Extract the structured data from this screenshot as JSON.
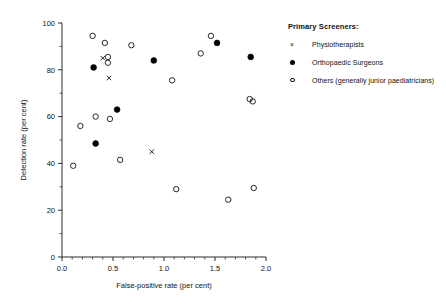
{
  "chart_data": {
    "type": "scatter",
    "title": "",
    "xlabel": "False-positive rate (per cent)",
    "ylabel": "Detection rate (per cent)",
    "xlim": [
      0.0,
      2.0
    ],
    "ylim": [
      0,
      100
    ],
    "xticks": [
      0.0,
      0.5,
      1.0,
      1.5,
      2.0
    ],
    "xtick_labels": [
      "0.0",
      "0.5",
      "1.0",
      "1.5",
      "2.0"
    ],
    "yticks": [
      0,
      20,
      40,
      60,
      80,
      100
    ],
    "ytick_labels": [
      "0",
      "20",
      "40",
      "60",
      "80",
      "100"
    ],
    "x_minor_step": 0.1,
    "y_minor_step": 10,
    "grid": false,
    "legend_position": "right-outside",
    "legend_title": "Primary Screeners:",
    "series": [
      {
        "name": "Physiotherapists",
        "marker": "cross",
        "color": "#111111",
        "points": [
          {
            "x": 0.4,
            "y": 85.0
          },
          {
            "x": 0.46,
            "y": 76.5
          },
          {
            "x": 0.88,
            "y": 45.0
          }
        ]
      },
      {
        "name": "Orthopaedic Surgeons",
        "marker": "filled-circle",
        "color": "#000000",
        "points": [
          {
            "x": 0.31,
            "y": 81.0
          },
          {
            "x": 0.33,
            "y": 48.5
          },
          {
            "x": 0.54,
            "y": 63.0
          },
          {
            "x": 0.9,
            "y": 84.0
          },
          {
            "x": 1.52,
            "y": 91.5
          },
          {
            "x": 1.85,
            "y": 85.5
          }
        ]
      },
      {
        "name": "Others (generally junior paediatricians)",
        "marker": "open-circle",
        "color": "#111111",
        "points": [
          {
            "x": 0.11,
            "y": 39.0
          },
          {
            "x": 0.18,
            "y": 56.0
          },
          {
            "x": 0.3,
            "y": 94.5
          },
          {
            "x": 0.33,
            "y": 60.0
          },
          {
            "x": 0.42,
            "y": 91.5
          },
          {
            "x": 0.45,
            "y": 85.5
          },
          {
            "x": 0.45,
            "y": 83.0
          },
          {
            "x": 0.47,
            "y": 59.0
          },
          {
            "x": 0.57,
            "y": 41.5
          },
          {
            "x": 0.68,
            "y": 90.5
          },
          {
            "x": 1.08,
            "y": 75.5
          },
          {
            "x": 1.12,
            "y": 29.0
          },
          {
            "x": 1.36,
            "y": 87.0
          },
          {
            "x": 1.46,
            "y": 94.5
          },
          {
            "x": 1.63,
            "y": 24.5
          },
          {
            "x": 1.84,
            "y": 67.5
          },
          {
            "x": 1.87,
            "y": 66.5
          },
          {
            "x": 1.88,
            "y": 29.5
          }
        ]
      }
    ]
  },
  "legend": {
    "title": "Primary Screeners:",
    "items": [
      {
        "label": "Physiotherapists",
        "marker": "cross"
      },
      {
        "label": "Orthopaedic Surgeons",
        "marker": "filled-circle"
      },
      {
        "label": "Others (generally junior paediatricians)",
        "marker": "open-circle"
      }
    ]
  }
}
